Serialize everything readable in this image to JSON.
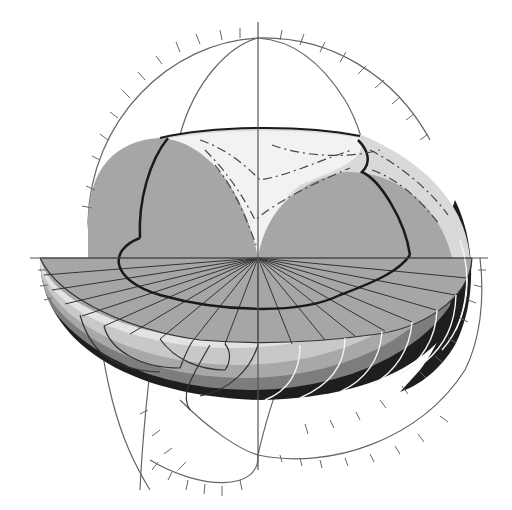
{
  "diagram": {
    "type": "3d-cutaway-spheroid",
    "colors": {
      "background": "#ffffff",
      "cut_face": "#a6a6a6",
      "cap_light": "#f2f2f2",
      "cap_mid": "#d9d9d9",
      "shell_band_1": "#e3e3e3",
      "shell_band_2": "#c8c8c8",
      "shell_band_3": "#a8a8a8",
      "shell_band_4": "#7d7d7d",
      "shell_shadow": "#1e1e1e",
      "axis_line": "#555555",
      "heavy_line": "#1a1a1a",
      "grid_line": "#333333",
      "white_contour": "#f4f4f4"
    },
    "axes": {
      "vertical": "center vertical axis",
      "horizontal": "center horizontal axis"
    },
    "text_labels": []
  }
}
